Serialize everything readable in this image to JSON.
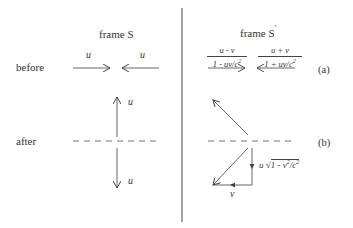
{
  "left_panel": {
    "title": "frame S",
    "row_a_label": "before",
    "row_b_label": "after",
    "before_arrow_left_label": "u",
    "before_arrow_right_label": "u",
    "after_arrow_up_label": "u",
    "after_arrow_down_label": "u"
  },
  "right_panel": {
    "title": "frame S",
    "title_prime": "′",
    "before_left_fraction": {
      "numerator": "u - v",
      "denominator_prefix": "1 - uv/c",
      "exp": "2"
    },
    "before_right_fraction": {
      "numerator": "u + v",
      "denominator_prefix": "1 + uv/c",
      "exp": "2"
    },
    "after_vertical_label_prefix": "u ",
    "after_vertical_label_sqrt": "√",
    "after_vertical_label_radicand": "1 - v",
    "after_vertical_label_exp1": "2",
    "after_vertical_label_mid": "/c",
    "after_vertical_label_exp2": "2",
    "after_horizontal_label": "v"
  },
  "row_tags": {
    "a": "(a)",
    "b": "(b)"
  },
  "colors": {
    "ink": "#333333",
    "line": "#555555",
    "background": "#ffffff"
  }
}
